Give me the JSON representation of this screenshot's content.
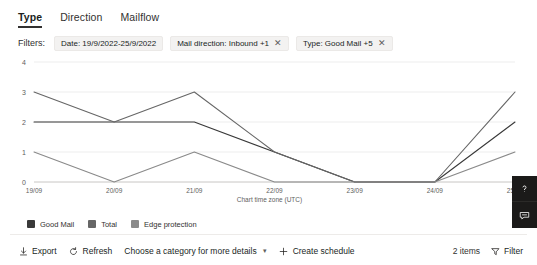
{
  "tabs": [
    {
      "label": "Type",
      "active": true
    },
    {
      "label": "Direction",
      "active": false
    },
    {
      "label": "Mailflow",
      "active": false
    }
  ],
  "filters": {
    "label": "Filters:",
    "chips": [
      {
        "text": "Date: 19/9/2022-25/9/2022",
        "removable": false
      },
      {
        "text": "Mail direction: Inbound +1",
        "removable": true
      },
      {
        "text": "Type: Good Mail +5",
        "removable": true
      }
    ],
    "remove_glyph": "✕"
  },
  "chart_data": {
    "type": "line",
    "title": "",
    "xlabel": "",
    "ylabel": "",
    "x": [
      "19/09",
      "20/09",
      "21/09",
      "22/09",
      "23/09",
      "24/09",
      "25/09"
    ],
    "ylim": [
      0,
      4
    ],
    "yticks": [
      0,
      1,
      2,
      3,
      4
    ],
    "grid": true,
    "legend_position": "bottom-left",
    "timezone_note": "Chart time zone (UTC)",
    "series": [
      {
        "name": "Good Mail",
        "color": "#393939",
        "values": [
          2,
          2,
          2,
          1,
          0,
          0,
          2
        ]
      },
      {
        "name": "Total",
        "color": "#666666",
        "values": [
          3,
          2,
          3,
          1,
          0,
          0,
          3
        ]
      },
      {
        "name": "Edge protection",
        "color": "#8a8a8a",
        "values": [
          1,
          0,
          1,
          0,
          0,
          0,
          1
        ]
      }
    ]
  },
  "toolbar": {
    "export_label": "Export",
    "refresh_label": "Refresh",
    "category_label": "Choose a category for more details",
    "create_schedule_label": "Create schedule",
    "items_count_label": "2 items",
    "filter_label": "Filter"
  },
  "side_buttons": [
    {
      "name": "help-icon"
    },
    {
      "name": "feedback-icon"
    }
  ]
}
